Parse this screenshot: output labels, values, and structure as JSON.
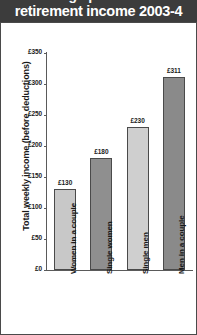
{
  "header": {
    "clipped_line": "average pensioners'",
    "title": "retirement income 2003-4",
    "background": "#3c3c3c",
    "text_color": "#ffffff"
  },
  "chart_data": {
    "type": "bar",
    "title": "retirement income 2003-4",
    "subtitle": "",
    "xlabel": "",
    "ylabel": "Total weekly income (before deductions)",
    "categories": [
      "Women in a couple",
      "Single women",
      "Single men",
      "Men in a couple"
    ],
    "values": [
      130,
      180,
      230,
      311
    ],
    "value_labels": [
      "£130",
      "£180",
      "£230",
      "£311"
    ],
    "ylim": [
      0,
      350
    ],
    "yticks": [
      0,
      50,
      100,
      150,
      200,
      250,
      300,
      350
    ],
    "ytick_labels": [
      "£0",
      "£50",
      "£100",
      "£150",
      "£200",
      "£250",
      "£300",
      "£350"
    ],
    "grid": false,
    "legend": "none",
    "bar_colors": [
      "#c8c8c8",
      "#8f8f8f",
      "#cfcfcf",
      "#8a8a8a"
    ],
    "bar_edge_color": "#4a4a4a",
    "axis_color": "#5a5a5a",
    "currency": "£",
    "units": "per week"
  }
}
